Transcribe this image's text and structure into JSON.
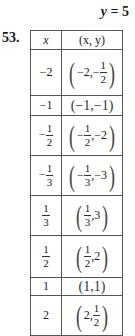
{
  "equation": {
    "lhs": "y",
    "eq": "= 5"
  },
  "problem_number": "53.",
  "table": {
    "headers": {
      "x": "x",
      "xy": "(x, y)"
    },
    "rows": [
      {
        "x": "−2",
        "pair": "(−2, −1/2)",
        "height": 46
      },
      {
        "x": "−1",
        "pair": "(−1, −1)",
        "height": 20
      },
      {
        "x": "−1/2",
        "pair": "(−1/2, −2)",
        "height": 40
      },
      {
        "x": "−1/3",
        "pair": "(−1/3, −3)",
        "height": 40
      },
      {
        "x": "1/3",
        "pair": "(1/3, 3)",
        "height": 40
      },
      {
        "x": "1/2",
        "pair": "(1/2, 2)",
        "height": 42
      },
      {
        "x": "1",
        "pair": "(1, 1)",
        "height": 18
      },
      {
        "x": "2",
        "pair": "(2, 1/2)",
        "height": 33
      }
    ]
  },
  "parts": {
    "neg": "−",
    "one": "1",
    "two": "2",
    "three": "3",
    "lp": "(",
    "rp": ")",
    "neg2": "−2,",
    "neg1": "−1",
    "neg1c": "(−1,−1)",
    "one1": "(1,1)",
    "c_neg2": ",−2",
    "c_neg3": ",−3",
    "c3": ",3",
    "c2": ",2",
    "two_c": "2,"
  }
}
